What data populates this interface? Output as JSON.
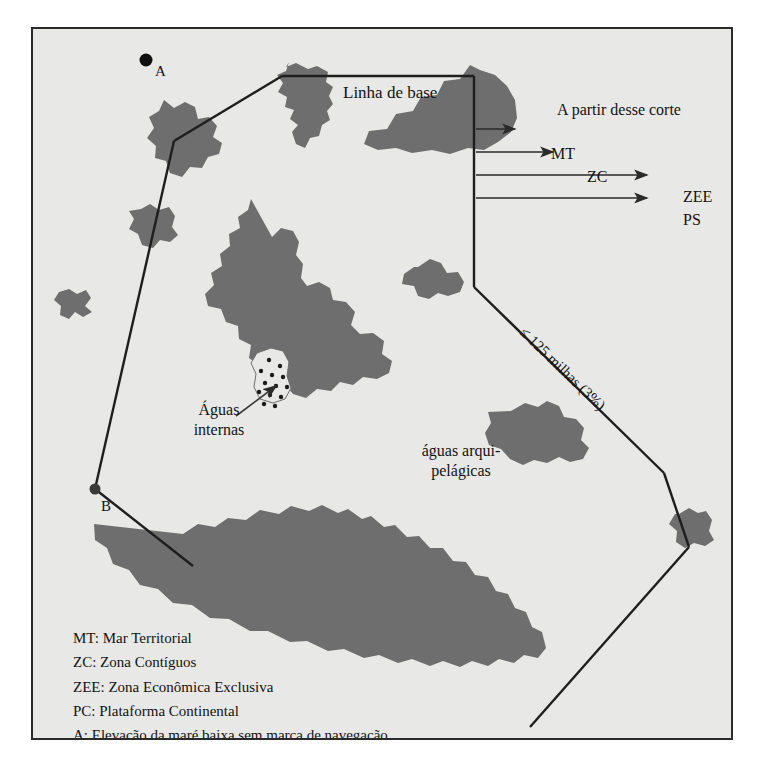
{
  "figure": {
    "background_color": "#e8e8e6",
    "frame_color": "#2a2a2a",
    "land_color": "#6e6e6e",
    "line_color": "#1e1e1e"
  },
  "labels": {
    "baseline": "Linha de base",
    "from_this_cut": "A partir desse corte",
    "distance": "≤ 125 milhas (3%)",
    "internal_waters_line1": "Águas",
    "internal_waters_line2": "internas",
    "archipelagic_line1": "águas arqui-",
    "archipelagic_line2": "pelágicas",
    "point_a": "A",
    "point_b": "B"
  },
  "arrows": [
    {
      "label": "MT"
    },
    {
      "label": "ZC"
    },
    {
      "label": "ZEE"
    },
    {
      "label": "PS"
    }
  ],
  "legend": [
    "MT: Mar Territorial",
    "ZC: Zona Contíguos",
    "ZEE: Zona Econômica Exclusiva",
    "PC: Plataforma Continental",
    "A: Elevação da maré baixa sem marca de navegação",
    "B: Elevação de pouca altura com marca de navegação"
  ]
}
